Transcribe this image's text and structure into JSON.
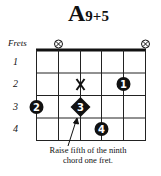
{
  "chord": {
    "root": "A",
    "extension": "9+5"
  },
  "frets_label": "Frets",
  "fret_numbers": [
    "1",
    "2",
    "3",
    "4"
  ],
  "muted_strings": [
    2,
    6
  ],
  "markers": [
    {
      "type": "x",
      "string": 3,
      "fret": 2
    },
    {
      "type": "finger",
      "finger": "1",
      "string": 5,
      "fret": 2
    },
    {
      "type": "finger",
      "finger": "2",
      "string": 1,
      "fret": 3
    },
    {
      "type": "finger-diamond",
      "finger": "3",
      "string": 3,
      "fret": 3
    },
    {
      "type": "finger",
      "finger": "4",
      "string": 4,
      "fret": 4
    }
  ],
  "caption": {
    "line1": "Raise fifth of the ninth",
    "line2": "chord one fret."
  }
}
